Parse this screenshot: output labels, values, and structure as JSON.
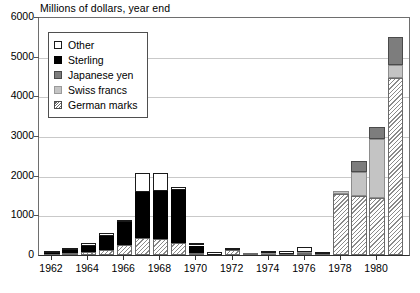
{
  "chart_data": {
    "type": "bar",
    "subtype": "stacked",
    "title": "Millions of dollars, year end",
    "xlabel": "",
    "ylabel": "Millions of dollars, year end",
    "ylim": [
      0,
      6000
    ],
    "ytick_values": [
      0,
      1000,
      2000,
      3000,
      4000,
      5000,
      6000
    ],
    "ytick_labels": [
      "0",
      "1000",
      "2000",
      "3000",
      "4000",
      "5000",
      "6000"
    ],
    "grid": true,
    "legend_position": "upper left",
    "categories": [
      "1962",
      "1963",
      "1964",
      "1965",
      "1966",
      "1967",
      "1968",
      "1969",
      "1970",
      "1971",
      "1972",
      "1973",
      "1974",
      "1975",
      "1976",
      "1977",
      "1978",
      "1979",
      "1980",
      "1981"
    ],
    "xtick_labels": [
      "1962",
      "1964",
      "1966",
      "1968",
      "1970",
      "1972",
      "1974",
      "1976",
      "1978",
      "1980"
    ],
    "series": [
      {
        "name": "German marks",
        "swatch": "marks",
        "values": [
          30,
          60,
          75,
          120,
          250,
          420,
          400,
          300,
          40,
          10,
          120,
          10,
          30,
          20,
          60,
          20,
          1550,
          1480,
          1430,
          4450
        ]
      },
      {
        "name": "Swiss francs",
        "swatch": "swiss",
        "values": [
          0,
          0,
          0,
          0,
          0,
          0,
          0,
          0,
          0,
          0,
          0,
          0,
          20,
          10,
          10,
          5,
          10,
          620,
          1500,
          350
        ]
      },
      {
        "name": "Japanese yen",
        "swatch": "yen",
        "values": [
          0,
          0,
          0,
          0,
          0,
          0,
          0,
          0,
          0,
          0,
          0,
          0,
          0,
          0,
          0,
          0,
          0,
          270,
          300,
          700
        ]
      },
      {
        "name": "Sterling",
        "swatch": "sterling",
        "values": [
          20,
          60,
          160,
          370,
          580,
          1180,
          1220,
          1340,
          200,
          0,
          0,
          0,
          0,
          0,
          0,
          0,
          0,
          0,
          0,
          0
        ]
      },
      {
        "name": "Other",
        "swatch": "other",
        "values": [
          10,
          60,
          45,
          40,
          30,
          470,
          440,
          10,
          10,
          10,
          20,
          0,
          20,
          60,
          130,
          10,
          0,
          0,
          0,
          0
        ]
      }
    ],
    "totals": [
      60,
      180,
      280,
      530,
      860,
      2070,
      2060,
      1650,
      250,
      20,
      140,
      10,
      70,
      90,
      200,
      35,
      1560,
      2370,
      3230,
      5500
    ]
  },
  "colors": {
    "other": "#ffffff",
    "sterling": "#000000",
    "japanese_yen": "#7d7d7d",
    "swiss_francs": "#c4c4c4",
    "german_marks": "#8a8a8a",
    "gridline": "#c9c9c9",
    "axis": "#2b2b2b",
    "text": "#000000"
  }
}
